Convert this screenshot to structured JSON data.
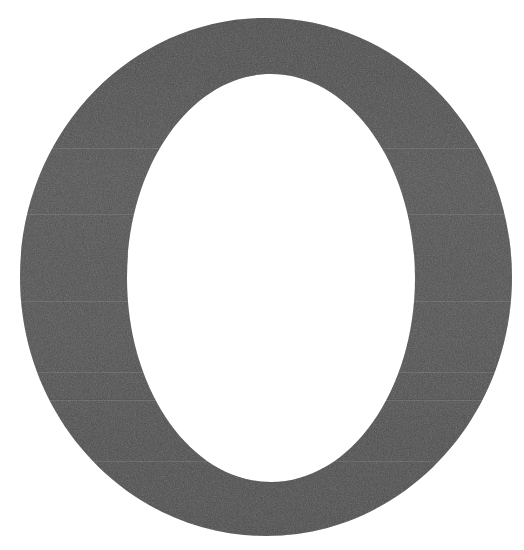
{
  "document": {
    "kind": "scanned-type-specimen",
    "title": "Letter O",
    "caption": ""
  },
  "canvas": {
    "width": 524,
    "height": 550,
    "background_color": "#ffffff"
  },
  "glyph": {
    "character": "O",
    "name": "latin-capital-letter-o",
    "script": "Latin",
    "case": "uppercase",
    "style": "serif-transitional",
    "fill_color": "#4d4d4d",
    "fill_color_light": "#585858",
    "fill_color_dark": "#414141",
    "counter_color": "#ffffff",
    "texture": "paper-grain-halftone",
    "stress": "vertical",
    "outer": {
      "center_x": 266,
      "center_y": 277,
      "radius_x": 246,
      "radius_y": 259,
      "left": 20,
      "right": 512,
      "top": 18,
      "bottom": 536
    },
    "counter": {
      "center_x": 271,
      "center_y": 278,
      "radius_x": 144,
      "radius_y": 204,
      "left": 127,
      "right": 415,
      "top": 74,
      "bottom": 482
    },
    "stroke_weight": {
      "left_px": 107,
      "right_px": 98,
      "top_px": 56,
      "bottom_px": 54
    }
  }
}
